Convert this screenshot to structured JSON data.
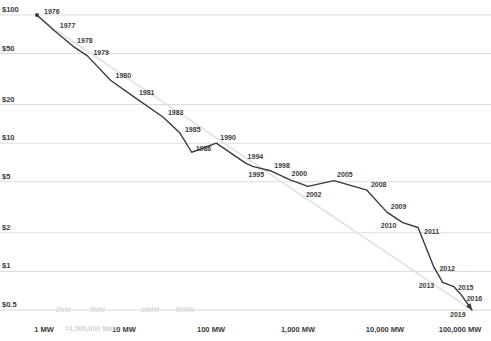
{
  "chart_data": {
    "type": "line",
    "title": "",
    "subtitle": "",
    "xlabel": "",
    "ylabel": "",
    "xscale": "log",
    "yscale": "log",
    "grid": true,
    "legend": "none",
    "xlim": [
      1,
      100000
    ],
    "ylim": [
      0.5,
      100
    ],
    "x_unit": "MW cumulative installed capacity",
    "y_unit": "$ per Watt",
    "y_ticks": [
      {
        "value": 100,
        "label": "$100"
      },
      {
        "value": 50,
        "label": "$50"
      },
      {
        "value": 20,
        "label": "$20"
      },
      {
        "value": 10,
        "label": "$10"
      },
      {
        "value": 5,
        "label": "$5"
      },
      {
        "value": 2,
        "label": "$2"
      },
      {
        "value": 1,
        "label": "$1"
      },
      {
        "value": 0.5,
        "label": "$0.5"
      }
    ],
    "x_ticks_major": [
      {
        "value": 1,
        "label": "1 MW"
      },
      {
        "value": 10,
        "label": "10 MW"
      },
      {
        "value": 100,
        "label": "100 MW"
      },
      {
        "value": 1000,
        "label": "1,000 MW"
      },
      {
        "value": 10000,
        "label": "10,000 MW"
      },
      {
        "value": 100000,
        "label": "100,000 MW"
      }
    ],
    "x_ticks_minor": [
      {
        "value": 2,
        "label": "2MW"
      },
      {
        "value": 5,
        "label": "5MW"
      },
      {
        "value": 20,
        "label": "20MW"
      },
      {
        "value": 50,
        "label": "50MW"
      }
    ],
    "x_axis_note": "=1,000,000 Watt",
    "series": [
      {
        "name": "Price per watt vs cumulative capacity",
        "color": "#3b3b3b",
        "marker_start": true,
        "arrow_end": true,
        "points": [
          {
            "label": "1976",
            "x": 1.0,
            "y": 100.0
          },
          {
            "label": "1977",
            "x": 1.6,
            "y": 75.0
          },
          {
            "label": "1978",
            "x": 2.6,
            "y": 57.0
          },
          {
            "label": "1979",
            "x": 3.8,
            "y": 48.0
          },
          {
            "label": "1980",
            "x": 7.0,
            "y": 31.0
          },
          {
            "label": "1981",
            "x": 13.0,
            "y": 23.0
          },
          {
            "label": "1983",
            "x": 28.0,
            "y": 16.0
          },
          {
            "label": "1985",
            "x": 44.0,
            "y": 12.0
          },
          {
            "label": "1986",
            "x": 60.0,
            "y": 8.5
          },
          {
            "label": "1990",
            "x": 115.0,
            "y": 10.0
          },
          {
            "label": "1994",
            "x": 250.0,
            "y": 7.0
          },
          {
            "label": "1995",
            "x": 300.0,
            "y": 6.6
          },
          {
            "label": "1998",
            "x": 480.0,
            "y": 6.1
          },
          {
            "label": "2000",
            "x": 800.0,
            "y": 5.2
          },
          {
            "label": "2002",
            "x": 1300.0,
            "y": 4.6
          },
          {
            "label": "2005",
            "x": 2600.0,
            "y": 5.1
          },
          {
            "label": "2008",
            "x": 6200.0,
            "y": 4.3
          },
          {
            "label": "2009",
            "x": 10500.0,
            "y": 2.9
          },
          {
            "label": "2010",
            "x": 16000.0,
            "y": 2.4
          },
          {
            "label": "2011",
            "x": 24000.0,
            "y": 2.2
          },
          {
            "label": "2012",
            "x": 36000.0,
            "y": 1.1
          },
          {
            "label": "2013",
            "x": 46000.0,
            "y": 0.82
          },
          {
            "label": "2015",
            "x": 62000.0,
            "y": 0.76
          },
          {
            "label": "2016",
            "x": 76000.0,
            "y": 0.65
          },
          {
            "label": "2019",
            "x": 100000.0,
            "y": 0.5
          }
        ]
      },
      {
        "name": "Learning-curve trend line",
        "color": "#e3e3e3",
        "style": "straight",
        "points": [
          {
            "x": 1.0,
            "y": 96.0
          },
          {
            "x": 100000.0,
            "y": 0.5
          }
        ]
      }
    ],
    "point_label_offsets": {
      "1976": [
        7,
        -4
      ],
      "1977": [
        5,
        -6
      ],
      "1978": [
        4,
        -6
      ],
      "1979": [
        6,
        -4
      ],
      "1980": [
        5,
        -5
      ],
      "1981": [
        5,
        -5
      ],
      "1983": [
        5,
        -5
      ],
      "1985": [
        5,
        -4
      ],
      "1986": [
        4,
        -4
      ],
      "1990": [
        4,
        -6
      ],
      "1994": [
        2,
        -7
      ],
      "1995": [
        -4,
        8
      ],
      "1998": [
        4,
        -6
      ],
      "2000": [
        2,
        -7
      ],
      "2002": [
        -2,
        8
      ],
      "2005": [
        3,
        -7
      ],
      "2008": [
        4,
        -6
      ],
      "2009": [
        4,
        -6
      ],
      "2010": [
        -22,
        2
      ],
      "2011": [
        6,
        3
      ],
      "2012": [
        6,
        2
      ],
      "2013": [
        -24,
        3
      ],
      "2015": [
        4,
        0
      ],
      "2016": [
        5,
        3
      ],
      "2019": [
        -22,
        4
      ]
    }
  }
}
